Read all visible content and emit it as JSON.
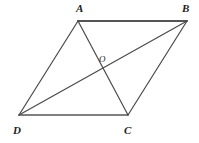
{
  "figure": {
    "type": "geometry-diagram",
    "shape": "parallelogram",
    "background_color": "#ffffff",
    "stroke_color": "#4a4a4a",
    "label_color": "#1c1c1c",
    "canvas": {
      "width": 199,
      "height": 143
    },
    "vertices": [
      {
        "name": "A",
        "label": "A",
        "x": 78,
        "y": 21,
        "label_x": 76,
        "label_y": 3
      },
      {
        "name": "B",
        "label": "B",
        "x": 187,
        "y": 21,
        "label_x": 182,
        "label_y": 3
      },
      {
        "name": "C",
        "label": "C",
        "x": 128,
        "y": 115,
        "label_x": 124,
        "label_y": 125
      },
      {
        "name": "D",
        "label": "D",
        "x": 19,
        "y": 115,
        "label_x": 13,
        "label_y": 125
      },
      {
        "name": "O",
        "label": "O",
        "x": 103,
        "y": 66,
        "label_x": 99,
        "label_y": 55
      }
    ],
    "edges": [
      {
        "name": "side-AB",
        "from": "A",
        "to": "B"
      },
      {
        "name": "side-BC",
        "from": "B",
        "to": "C"
      },
      {
        "name": "side-CD",
        "from": "C",
        "to": "D"
      },
      {
        "name": "side-DA",
        "from": "D",
        "to": "A"
      },
      {
        "name": "diagonal-AC",
        "from": "A",
        "to": "C"
      },
      {
        "name": "diagonal-BD",
        "from": "B",
        "to": "D"
      }
    ]
  }
}
